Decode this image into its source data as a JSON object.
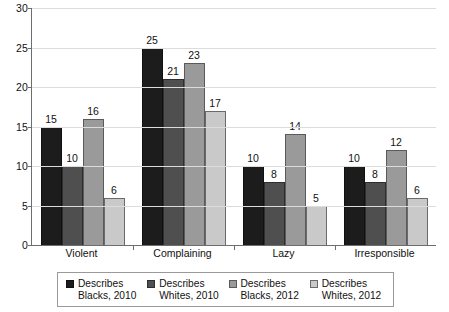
{
  "chart_data": {
    "type": "bar",
    "title": "",
    "xlabel": "",
    "ylabel": "",
    "ylim": [
      0,
      30
    ],
    "yticks": [
      0,
      5,
      10,
      15,
      20,
      25,
      30
    ],
    "grid": true,
    "legend_position": "bottom",
    "categories": [
      "Violent",
      "Complaining",
      "Lazy",
      "Irresponsible"
    ],
    "series": [
      {
        "name": "Describes Blacks, 2010",
        "color": "#1c1c1c",
        "values": [
          15,
          25,
          10,
          10
        ]
      },
      {
        "name": "Describes Whites, 2010",
        "color": "#4f4f4f",
        "values": [
          10,
          21,
          8,
          8
        ]
      },
      {
        "name": "Describes Blacks, 2012",
        "color": "#9a9a9a",
        "values": [
          16,
          23,
          14,
          12
        ]
      },
      {
        "name": "Describes Whites, 2012",
        "color": "#c9c9c9",
        "values": [
          6,
          17,
          5,
          6
        ]
      }
    ]
  },
  "legend": {
    "items": [
      {
        "label": "Describes\nBlacks, 2010"
      },
      {
        "label": "Describes\nWhites, 2010"
      },
      {
        "label": "Describes\nBlacks, 2012"
      },
      {
        "label": "Describes\nWhites, 2012"
      }
    ]
  }
}
